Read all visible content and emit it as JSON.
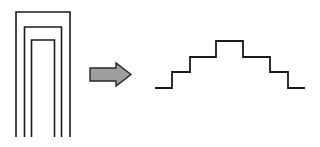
{
  "figure": {
    "background_color": "#ffffff",
    "width": 320,
    "height": 147,
    "stroke_color": "#1a1a1a",
    "arrow_fill_color": "#9e9e9e",
    "arrow_stroke_color": "#262626"
  },
  "left_shape": {
    "name": "nested-arches",
    "description": "Three nested inverted-U (open bottom) rectangular outlines",
    "stroke_width": 1.6,
    "arches": [
      {
        "label": "outer-arch",
        "left": 16,
        "right": 70,
        "top": 12,
        "bottom": 137
      },
      {
        "label": "middle-arch",
        "left": 24.5,
        "right": 61.5,
        "top": 27,
        "bottom": 137
      },
      {
        "label": "inner-arch",
        "left": 31.5,
        "right": 54.5,
        "top": 40,
        "bottom": 137
      }
    ]
  },
  "arrow": {
    "name": "transformation-arrow",
    "direction": "right",
    "tail_left": 90,
    "tail_right": 116,
    "tail_top": 68,
    "tail_bottom": 81,
    "head_left": 116,
    "head_tip_x": 131,
    "head_top": 63,
    "head_bottom": 86,
    "center_y": 74.5,
    "stroke_width": 1.4
  },
  "right_shape": {
    "name": "stepped-profile",
    "description": "Symmetric staircase profile: three steps up to a plateau, then three steps down",
    "stroke_width": 1.8,
    "levels_y": [
      88,
      72,
      57,
      41
    ],
    "points": [
      [
        155,
        88
      ],
      [
        172,
        88
      ],
      [
        172,
        72
      ],
      [
        190,
        72
      ],
      [
        190,
        57
      ],
      [
        216,
        57
      ],
      [
        216,
        41
      ],
      [
        243,
        41
      ],
      [
        243,
        57
      ],
      [
        270,
        57
      ],
      [
        270,
        72
      ],
      [
        288,
        72
      ],
      [
        288,
        88
      ],
      [
        305,
        88
      ]
    ],
    "step_count_up": 3,
    "step_count_down": 3,
    "plateau": {
      "left": 216,
      "right": 243,
      "y": 41
    }
  }
}
